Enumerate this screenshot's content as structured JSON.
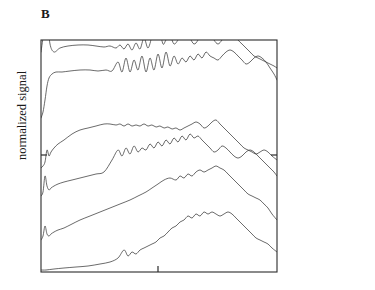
{
  "figure": {
    "panel_letter": "B",
    "y_axis_label": "normalized signal"
  },
  "plot_area": {
    "x0": 41,
    "y0": 40,
    "x1": 277,
    "y1": 272
  },
  "axis_ticks": {
    "bottom_x": 158,
    "left_y": 155,
    "right_y": 155
  },
  "legend_groups": [
    {
      "time": "36h",
      "rows": [
        {
          "number": "9",
          "sample": "N."
        },
        {
          "number": "10",
          "sample": "i.S."
        }
      ],
      "top_y": 78,
      "row_gap": 28,
      "label_x": 286,
      "bracket_x": 330,
      "time_x": 340,
      "time_y": 92
    },
    {
      "time": "18h",
      "rows": [
        {
          "number": "4",
          "sample": "N."
        },
        {
          "number": "6",
          "sample": "i.S."
        }
      ],
      "top_y": 176,
      "row_gap": 16,
      "label_x": 286,
      "bracket_x": 330,
      "time_x": 340,
      "time_y": 184
    },
    {
      "time": "10h",
      "rows": [
        {
          "number": "1",
          "sample": "N."
        },
        {
          "number": "2",
          "sample": "i.S."
        }
      ],
      "top_y": 240,
      "row_gap": 20,
      "label_x": 286,
      "bracket_x": 330,
      "time_x": 340,
      "time_y": 250
    }
  ],
  "chart_data": {
    "type": "line",
    "title": "B",
    "xlabel": "",
    "ylabel": "normalized signal",
    "grid": false,
    "legend_position": "right",
    "axis_ranges": {
      "x": [
        0,
        1
      ],
      "y": [
        0,
        1
      ]
    },
    "series": [
      {
        "name": "9 N.",
        "group": "36h",
        "baseline_y": 58,
        "x": [
          41,
          44,
          46,
          47,
          48,
          50,
          54,
          60,
          68,
          78,
          88,
          96,
          104,
          110,
          116,
          120,
          124,
          128,
          132,
          136,
          140,
          144,
          148,
          152,
          156,
          158,
          160,
          163,
          166,
          170,
          174,
          178,
          182,
          186,
          190,
          194,
          198,
          202,
          206,
          210,
          214,
          218,
          222,
          226,
          230,
          234,
          238,
          242,
          246,
          250,
          254,
          258,
          262,
          266,
          270,
          274,
          277
        ],
        "y": [
          52,
          30,
          10,
          6,
          22,
          44,
          52,
          48,
          46,
          45,
          45,
          46,
          47,
          46,
          48,
          45,
          49,
          44,
          50,
          43,
          49,
          38,
          48,
          36,
          22,
          14,
          30,
          44,
          40,
          36,
          44,
          40,
          34,
          30,
          38,
          44,
          40,
          30,
          26,
          32,
          40,
          44,
          40,
          34,
          30,
          34,
          40,
          44,
          48,
          52,
          56,
          58,
          60,
          62,
          64,
          66,
          68
        ]
      },
      {
        "name": "10 i.S.",
        "group": "36h",
        "baseline_y": 100,
        "x": [
          41,
          43,
          45,
          47,
          49,
          52,
          56,
          62,
          70,
          80,
          90,
          98,
          106,
          112,
          118,
          122,
          126,
          130,
          134,
          138,
          142,
          146,
          150,
          154,
          158,
          162,
          166,
          170,
          174,
          178,
          182,
          186,
          190,
          194,
          198,
          202,
          206,
          210,
          214,
          218,
          222,
          226,
          230,
          234,
          238,
          242,
          246,
          250,
          254,
          258,
          262,
          266,
          270,
          274,
          277
        ],
        "y": [
          118,
          112,
          100,
          86,
          78,
          74,
          72,
          72,
          71,
          70,
          70,
          71,
          70,
          71,
          62,
          72,
          58,
          72,
          60,
          70,
          56,
          72,
          58,
          70,
          54,
          68,
          52,
          66,
          56,
          64,
          58,
          62,
          56,
          60,
          54,
          58,
          52,
          56,
          58,
          60,
          56,
          52,
          50,
          52,
          56,
          60,
          64,
          62,
          58,
          56,
          58,
          62,
          68,
          74,
          80
        ]
      },
      {
        "name": "4 N.",
        "group": "18h",
        "baseline_y": 148,
        "x": [
          41,
          43,
          45,
          47,
          49,
          51,
          54,
          58,
          64,
          72,
          80,
          88,
          96,
          104,
          110,
          116,
          120,
          124,
          128,
          132,
          136,
          140,
          144,
          148,
          152,
          156,
          160,
          164,
          168,
          172,
          176,
          180,
          184,
          188,
          192,
          196,
          200,
          204,
          208,
          212,
          216,
          220,
          224,
          228,
          232,
          236,
          240,
          244,
          248,
          252,
          256,
          260,
          264,
          268,
          272,
          277
        ],
        "y": [
          168,
          166,
          162,
          150,
          156,
          152,
          148,
          144,
          140,
          134,
          130,
          128,
          126,
          124,
          124,
          125,
          124,
          126,
          124,
          126,
          125,
          126,
          124,
          126,
          125,
          127,
          126,
          128,
          127,
          129,
          128,
          130,
          128,
          126,
          124,
          122,
          124,
          128,
          126,
          122,
          120,
          124,
          128,
          132,
          136,
          140,
          144,
          148,
          150,
          152,
          154,
          152,
          150,
          152,
          156,
          160
        ]
      },
      {
        "name": "6 i.S.",
        "group": "18h",
        "baseline_y": 190,
        "x": [
          41,
          43,
          45,
          47,
          49,
          51,
          54,
          58,
          64,
          72,
          80,
          88,
          96,
          104,
          112,
          118,
          122,
          126,
          130,
          134,
          138,
          142,
          146,
          150,
          154,
          158,
          162,
          166,
          170,
          174,
          178,
          182,
          186,
          190,
          194,
          198,
          202,
          206,
          210,
          214,
          218,
          222,
          226,
          230,
          234,
          238,
          242,
          246,
          250,
          254,
          258,
          262,
          266,
          270,
          274,
          277
        ],
        "y": [
          196,
          192,
          176,
          186,
          190,
          188,
          186,
          184,
          182,
          180,
          178,
          176,
          174,
          172,
          160,
          150,
          156,
          148,
          154,
          146,
          152,
          148,
          150,
          144,
          148,
          142,
          146,
          140,
          144,
          138,
          142,
          136,
          140,
          134,
          138,
          136,
          140,
          144,
          148,
          152,
          150,
          146,
          148,
          152,
          156,
          158,
          156,
          152,
          150,
          152,
          156,
          160,
          164,
          168,
          172,
          176
        ]
      },
      {
        "name": "1 N.",
        "group": "10h",
        "baseline_y": 236,
        "x": [
          41,
          43,
          45,
          47,
          49,
          51,
          54,
          58,
          64,
          72,
          80,
          90,
          100,
          110,
          120,
          130,
          138,
          146,
          152,
          158,
          164,
          170,
          176,
          180,
          184,
          188,
          192,
          196,
          200,
          204,
          208,
          212,
          216,
          220,
          224,
          228,
          232,
          236,
          240,
          244,
          248,
          252,
          256,
          260,
          264,
          268,
          272,
          277
        ],
        "y": [
          240,
          236,
          226,
          234,
          236,
          234,
          232,
          230,
          228,
          224,
          220,
          216,
          212,
          208,
          204,
          200,
          196,
          192,
          188,
          184,
          180,
          178,
          180,
          176,
          178,
          174,
          176,
          172,
          170,
          172,
          170,
          168,
          166,
          168,
          170,
          174,
          178,
          182,
          186,
          190,
          194,
          196,
          198,
          200,
          204,
          208,
          214,
          220
        ]
      },
      {
        "name": "2 i.S.",
        "group": "10h",
        "baseline_y": 268,
        "x": [
          41,
          46,
          54,
          64,
          76,
          88,
          100,
          110,
          118,
          124,
          128,
          132,
          136,
          140,
          144,
          148,
          152,
          156,
          160,
          164,
          168,
          172,
          176,
          180,
          184,
          188,
          192,
          196,
          200,
          204,
          208,
          212,
          216,
          220,
          224,
          228,
          232,
          236,
          240,
          244,
          248,
          252,
          256,
          260,
          264,
          268,
          272,
          277
        ],
        "y": [
          270,
          270,
          269,
          268,
          267,
          266,
          264,
          262,
          258,
          250,
          256,
          252,
          254,
          250,
          248,
          246,
          244,
          242,
          238,
          236,
          232,
          228,
          226,
          222,
          220,
          216,
          218,
          214,
          216,
          212,
          214,
          212,
          214,
          216,
          214,
          212,
          214,
          218,
          222,
          226,
          230,
          234,
          238,
          240,
          242,
          244,
          248,
          252
        ]
      }
    ]
  }
}
